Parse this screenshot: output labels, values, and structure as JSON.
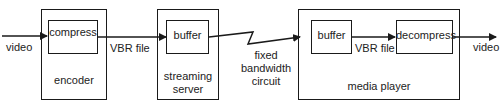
{
  "diagram": {
    "input_label": "video",
    "output_label": "video",
    "encoder": {
      "title": "encoder",
      "inner": "compress"
    },
    "link1_label": "VBR file",
    "streaming_server": {
      "title_line1": "streaming",
      "title_line2": "server",
      "inner": "buffer"
    },
    "circuit": {
      "line1": "fixed",
      "line2": "bandwidth",
      "line3": "circuit"
    },
    "media_player": {
      "title": "media player",
      "inner_left": "buffer",
      "inner_link_label": "VBR file",
      "inner_right": "decompress"
    },
    "colors": {
      "stroke": "#1a1a1a",
      "background": "#ffffff"
    }
  }
}
